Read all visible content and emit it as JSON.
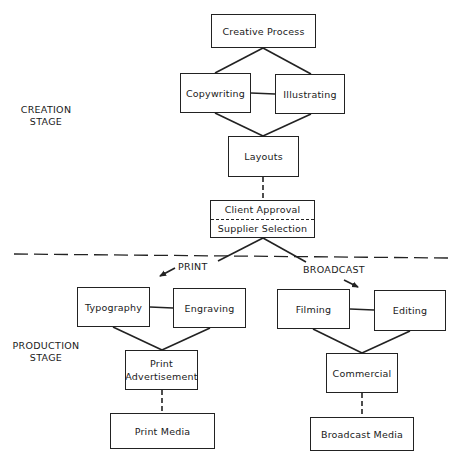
{
  "diagram": {
    "stages": {
      "creation": {
        "line1": "CREATION",
        "line2": "STAGE"
      },
      "production": {
        "line1": "PRODUCTION",
        "line2": "STAGE"
      }
    },
    "branches": {
      "print": "PRINT",
      "broadcast": "BROADCAST"
    },
    "nodes": {
      "creative_process": "Creative Process",
      "copywriting": "Copywriting",
      "illustrating": "Illustrating",
      "layouts": "Layouts",
      "client_approval": "Client Approval",
      "supplier_selection": "Supplier Selection",
      "typography": "Typography",
      "engraving": "Engraving",
      "print_advertisement_line1": "Print",
      "print_advertisement_line2": "Advertisement",
      "print_media": "Print Media",
      "filming": "Filming",
      "editing": "Editing",
      "commercial": "Commercial",
      "broadcast_media": "Broadcast Media"
    },
    "edges": [
      {
        "from": "Creative Process",
        "to": "Copywriting",
        "style": "solid"
      },
      {
        "from": "Creative Process",
        "to": "Illustrating",
        "style": "solid"
      },
      {
        "from": "Copywriting",
        "to": "Illustrating",
        "style": "solid"
      },
      {
        "from": "Copywriting",
        "to": "Layouts",
        "style": "solid"
      },
      {
        "from": "Illustrating",
        "to": "Layouts",
        "style": "solid"
      },
      {
        "from": "Layouts",
        "to": "Client Approval",
        "style": "dashed"
      },
      {
        "from": "Supplier Selection",
        "to": "PRINT",
        "style": "arrow"
      },
      {
        "from": "Supplier Selection",
        "to": "BROADCAST",
        "style": "arrow"
      },
      {
        "from": "Typography",
        "to": "Engraving",
        "style": "solid"
      },
      {
        "from": "Typography",
        "to": "Print Advertisement",
        "style": "solid"
      },
      {
        "from": "Engraving",
        "to": "Print Advertisement",
        "style": "solid"
      },
      {
        "from": "Print Advertisement",
        "to": "Print Media",
        "style": "dashed"
      },
      {
        "from": "Filming",
        "to": "Editing",
        "style": "solid"
      },
      {
        "from": "Filming",
        "to": "Commercial",
        "style": "solid"
      },
      {
        "from": "Editing",
        "to": "Commercial",
        "style": "solid"
      },
      {
        "from": "Commercial",
        "to": "Broadcast Media",
        "style": "dashed"
      }
    ]
  }
}
